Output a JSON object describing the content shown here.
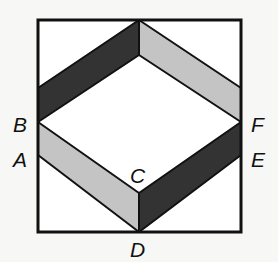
{
  "figure": {
    "colors": {
      "background": "#f7f7f5",
      "outline": "#111111",
      "dark_band": "#333333",
      "light_band": "#c4c4c4",
      "white_region": "#ffffff"
    },
    "labels": {
      "A": "A",
      "B": "B",
      "C": "C",
      "D": "D",
      "E": "E",
      "F": "F"
    },
    "regions": [
      {
        "name": "upper-left band",
        "shade": "dark"
      },
      {
        "name": "upper-right band",
        "shade": "light"
      },
      {
        "name": "lower-left band",
        "shade": "light"
      },
      {
        "name": "lower-right band",
        "shade": "dark"
      }
    ]
  }
}
